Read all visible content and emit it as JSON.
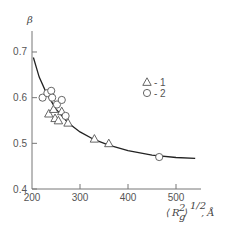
{
  "chart_data": {
    "type": "scatter",
    "title": "",
    "ylabel": "β",
    "xlabel": "⟨R_g²⟩^1/2, Å",
    "xlabel_parts": {
      "open": "⟨",
      "var": "R",
      "sub": "g",
      "sup": "2",
      "close": "⟩",
      "exp": "1/2",
      "unit": ", Å"
    },
    "xlim": [
      200,
      550
    ],
    "ylim": [
      0.4,
      0.75
    ],
    "xticks": [
      200,
      300,
      400,
      500
    ],
    "xtick_labels": [
      "200",
      "300",
      "400",
      "500"
    ],
    "yticks": [
      0.4,
      0.5,
      0.6,
      0.7
    ],
    "ytick_labels": [
      "0.4",
      "0.5",
      "0.6",
      "0.7"
    ],
    "grid": false,
    "legend_position": "upper-right",
    "series": [
      {
        "name": "1",
        "legend_label": "- 1",
        "marker": "triangle",
        "points": [
          {
            "x": 235,
            "y": 0.565
          },
          {
            "x": 245,
            "y": 0.575
          },
          {
            "x": 248,
            "y": 0.555
          },
          {
            "x": 255,
            "y": 0.55
          },
          {
            "x": 262,
            "y": 0.57
          },
          {
            "x": 275,
            "y": 0.545
          },
          {
            "x": 330,
            "y": 0.51
          },
          {
            "x": 360,
            "y": 0.5
          }
        ]
      },
      {
        "name": "2",
        "legend_label": "- 2",
        "marker": "circle",
        "points": [
          {
            "x": 222,
            "y": 0.6
          },
          {
            "x": 232,
            "y": 0.61
          },
          {
            "x": 240,
            "y": 0.615
          },
          {
            "x": 242,
            "y": 0.6
          },
          {
            "x": 252,
            "y": 0.585
          },
          {
            "x": 262,
            "y": 0.595
          },
          {
            "x": 270,
            "y": 0.56
          },
          {
            "x": 465,
            "y": 0.47
          }
        ]
      }
    ],
    "fit_curve": {
      "description": "decaying fit curve",
      "points": [
        {
          "x": 203,
          "y": 0.688
        },
        {
          "x": 215,
          "y": 0.645
        },
        {
          "x": 230,
          "y": 0.61
        },
        {
          "x": 250,
          "y": 0.575
        },
        {
          "x": 275,
          "y": 0.545
        },
        {
          "x": 300,
          "y": 0.525
        },
        {
          "x": 330,
          "y": 0.508
        },
        {
          "x": 360,
          "y": 0.496
        },
        {
          "x": 400,
          "y": 0.484
        },
        {
          "x": 450,
          "y": 0.474
        },
        {
          "x": 500,
          "y": 0.469
        },
        {
          "x": 540,
          "y": 0.467
        }
      ]
    }
  }
}
